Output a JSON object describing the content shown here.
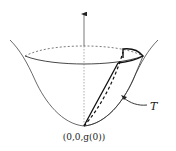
{
  "diagram": {
    "labels": {
      "region": "T",
      "apex": "(0,0,g(0))"
    },
    "colors": {
      "stroke": "#222222",
      "axis": "#555555",
      "background": "#ffffff"
    }
  }
}
